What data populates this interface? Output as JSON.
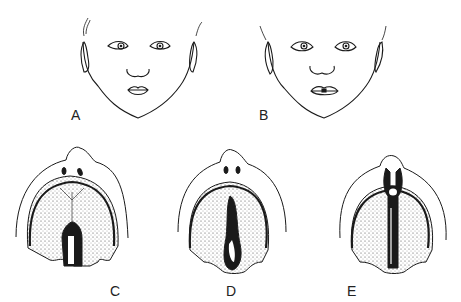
{
  "figure": {
    "panels": [
      {
        "id": "A",
        "label": "A",
        "kind": "face-frontal"
      },
      {
        "id": "B",
        "label": "B",
        "kind": "face-frontal"
      },
      {
        "id": "C",
        "label": "C",
        "kind": "palate-view"
      },
      {
        "id": "D",
        "label": "D",
        "kind": "palate-view"
      },
      {
        "id": "E",
        "label": "E",
        "kind": "palate-view"
      }
    ],
    "colors": {
      "line": "#1a1a1a",
      "stipple": "#555555",
      "background": "#ffffff"
    }
  }
}
